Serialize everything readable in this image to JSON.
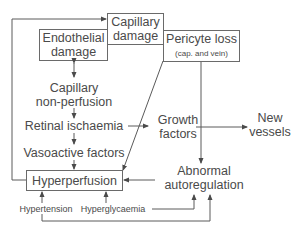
{
  "diagram": {
    "title": "",
    "nodes": {
      "capillary_damage": {
        "line1": "Capillary",
        "line2": "damage"
      },
      "endothelial_damage": {
        "line1": "Endothelial",
        "line2": "damage"
      },
      "pericyte_loss": {
        "line1": "Pericyte loss",
        "line2": "(cap. and vein)"
      },
      "capillary_nonperfusion": {
        "line1": "Capillary",
        "line2": "non-perfusion"
      },
      "retinal_ischaemia": {
        "label": "Retinal ischaemia"
      },
      "vasoactive_factors": {
        "label": "Vasoactive factors"
      },
      "growth_factors": {
        "line1": "Growth",
        "line2": "factors"
      },
      "new_vessels": {
        "line1": "New",
        "line2": "vessels"
      },
      "hyperperfusion": {
        "label": "Hyperperfusion"
      },
      "abnormal_autoregulation": {
        "line1": "Abnormal",
        "line2": "autoregulation"
      },
      "hypertension": {
        "label": "Hypertension"
      },
      "hyperglycaemia": {
        "label": "Hyperglycaemia"
      }
    },
    "edges": [
      {
        "from": "hyperperfusion",
        "to": "capillary_damage",
        "note": "feedback loop via left side"
      },
      {
        "from": "endothelial_damage",
        "to": "capillary_nonperfusion",
        "note": "bidirectional"
      },
      {
        "from": "capillary_nonperfusion",
        "to": "retinal_ischaemia"
      },
      {
        "from": "retinal_ischaemia",
        "to": "vasoactive_factors"
      },
      {
        "from": "retinal_ischaemia",
        "to": "growth_factors"
      },
      {
        "from": "vasoactive_factors",
        "to": "hyperperfusion"
      },
      {
        "from": "pericyte_loss",
        "to": "hyperperfusion"
      },
      {
        "from": "pericyte_loss",
        "to": "abnormal_autoregulation"
      },
      {
        "from": "growth_factors",
        "to": "new_vessels"
      },
      {
        "from": "abnormal_autoregulation",
        "to": "hyperperfusion"
      },
      {
        "from": "hypertension",
        "to": "hyperperfusion"
      },
      {
        "from": "hyperglycaemia",
        "to": "hyperperfusion"
      },
      {
        "from": "hyperglycaemia",
        "to": "abnormal_autoregulation"
      },
      {
        "from": "hypertension",
        "to": "abnormal_autoregulation"
      }
    ],
    "colors": {
      "stroke": "#5a5a5a",
      "text": "#4a4a4a",
      "background": "#ffffff"
    }
  }
}
